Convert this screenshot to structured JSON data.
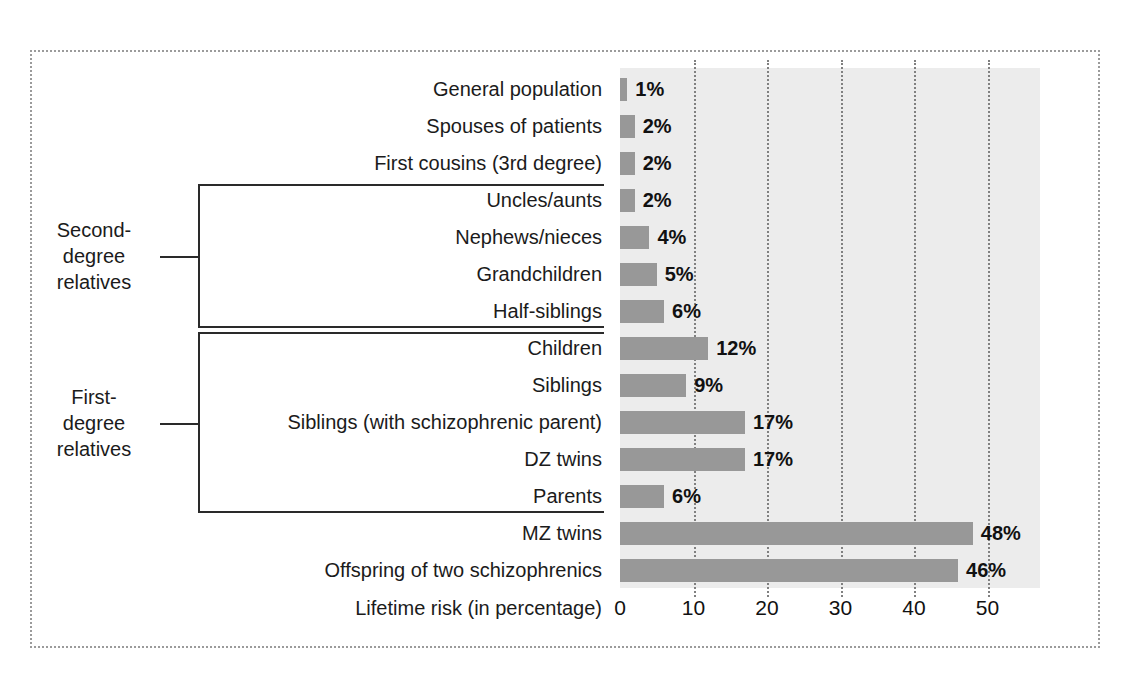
{
  "chart_data": {
    "type": "bar",
    "orientation": "horizontal",
    "title": "",
    "xlabel": "Lifetime risk (in percentage)",
    "ylabel": "",
    "xlim": [
      0,
      57
    ],
    "xticks": [
      0,
      10,
      20,
      30,
      40,
      50
    ],
    "xtick_labels": [
      "0",
      "10",
      "20",
      "30",
      "40",
      "50"
    ],
    "grid": true,
    "grid_axis": "x",
    "grid_style": "dotted",
    "legend": "none",
    "categories": [
      "General population",
      "Spouses of patients",
      "First cousins (3rd degree)",
      "Uncles/aunts",
      "Nephews/nieces",
      "Grandchildren",
      "Half-siblings",
      "Children",
      "Siblings",
      "Siblings (with schizophrenic parent)",
      "DZ twins",
      "Parents",
      "MZ twins",
      "Offspring of two schizophrenics"
    ],
    "values": [
      1,
      2,
      2,
      2,
      4,
      5,
      6,
      12,
      9,
      17,
      17,
      6,
      48,
      46
    ],
    "value_labels": [
      "1%",
      "2%",
      "2%",
      "2%",
      "4%",
      "5%",
      "6%",
      "12%",
      "9%",
      "17%",
      "17%",
      "6%",
      "48%",
      "46%"
    ],
    "bar_color": "#989898",
    "plot_background": "#ececec",
    "annotations": [
      {
        "label": "Second-degree relatives",
        "label_lines": [
          "Second-",
          "degree",
          "relatives"
        ],
        "spans": [
          "Uncles/aunts",
          "Nephews/nieces",
          "Grandchildren",
          "Half-siblings"
        ]
      },
      {
        "label": "First-degree relatives",
        "label_lines": [
          "First-",
          "degree",
          "relatives"
        ],
        "spans": [
          "Children",
          "Siblings",
          "Siblings (with schizophrenic parent)",
          "DZ twins",
          "Parents"
        ]
      }
    ]
  },
  "figure": {
    "frame_color": "#9b9b9b",
    "background": "#ffffff"
  }
}
